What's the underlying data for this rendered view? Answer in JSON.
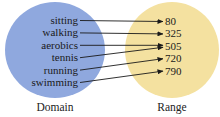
{
  "domain": {
    "caption": "Domain",
    "color": "#8fa8de",
    "items": [
      "sitting",
      "walking",
      "aerobics",
      "tennis",
      "running",
      "swimming"
    ]
  },
  "range": {
    "caption": "Range",
    "color": "#f4e1a0",
    "items": [
      "80",
      "325",
      "505",
      "720",
      "790"
    ]
  },
  "mapping": [
    {
      "from": "sitting",
      "to": "80"
    },
    {
      "from": "walking",
      "to": "325"
    },
    {
      "from": "aerobics",
      "to": "505"
    },
    {
      "from": "tennis",
      "to": "505"
    },
    {
      "from": "running",
      "to": "720"
    },
    {
      "from": "swimming",
      "to": "790"
    }
  ],
  "arrow_color": "#1a1a1a"
}
